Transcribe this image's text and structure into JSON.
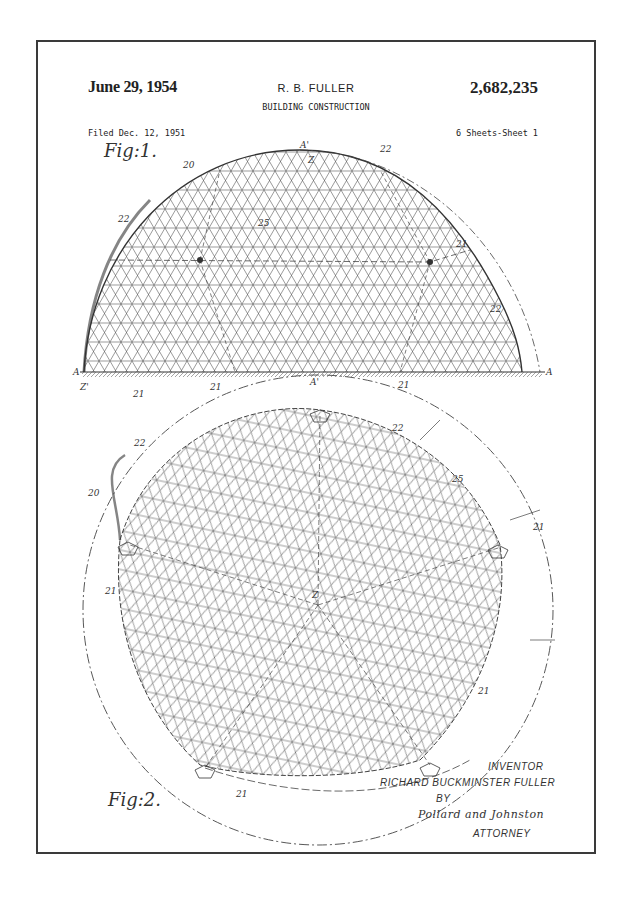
{
  "header": {
    "date": "June 29, 1954",
    "inventor_short": "R. B. FULLER",
    "patent_number": "2,682,235",
    "title": "BUILDING CONSTRUCTION",
    "filed": "Filed Dec. 12, 1951",
    "sheets": "6 Sheets-Sheet 1"
  },
  "figures": {
    "fig1_label": "Fig:1.",
    "fig2_label": "Fig:2."
  },
  "reference_numerals": {
    "fig1": [
      "20",
      "22",
      "22",
      "25",
      "21",
      "22",
      "21",
      "21",
      "21",
      "A",
      "A",
      "A'",
      "A'",
      "Z",
      "Z'"
    ],
    "fig2": [
      "22",
      "20",
      "21",
      "22",
      "25",
      "21",
      "Z",
      "21",
      "21"
    ]
  },
  "signature_block": {
    "inventor_caption": "INVENTOR",
    "inventor_name": "RICHARD BUCKMINSTER FULLER",
    "by": "BY",
    "firm_signature": "Pollard and Johnston",
    "attorney_caption": "ATTORNEY"
  },
  "colors": {
    "ink": "#333333",
    "border": "#3a3a3a",
    "paper": "#ffffff"
  }
}
